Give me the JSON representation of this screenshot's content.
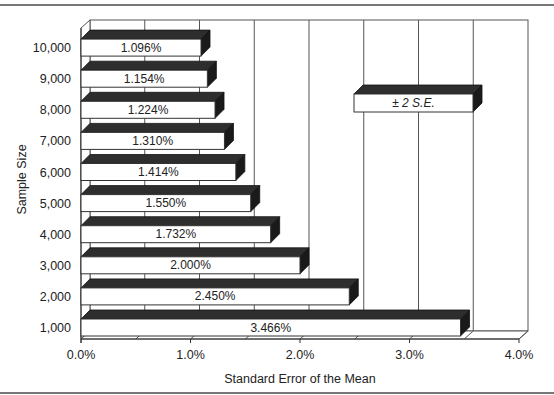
{
  "chart_data": {
    "type": "bar",
    "orientation": "horizontal",
    "style": "3d",
    "title": "",
    "xlabel": "Standard Error of the Mean",
    "ylabel": "Sample Size",
    "xlim": [
      0,
      4.0
    ],
    "x_ticks": [
      "0.0%",
      "1.0%",
      "2.0%",
      "3.0%",
      "4.0%"
    ],
    "grid": true,
    "legend": {
      "position": "upper-right-inside",
      "entries": [
        "± 2 S.E."
      ]
    },
    "categories": [
      "1,000",
      "2,000",
      "3,000",
      "4,000",
      "5,000",
      "6,000",
      "7,000",
      "8,000",
      "9,000",
      "10,000"
    ],
    "series": [
      {
        "name": "± 2 S.E.",
        "values": [
          3.466,
          2.45,
          2.0,
          1.732,
          1.55,
          1.414,
          1.31,
          1.224,
          1.154,
          1.096
        ],
        "labels": [
          "3.466%",
          "2.450%",
          "2.000%",
          "1.732%",
          "1.550%",
          "1.414%",
          "1.310%",
          "1.224%",
          "1.154%",
          "1.096%"
        ]
      }
    ]
  },
  "colors": {
    "bar_front": "#ffffff",
    "bar_top": "#2e2e2e",
    "bar_side": "#1a1a1a",
    "grid": "#555555",
    "rule": "#777777"
  }
}
